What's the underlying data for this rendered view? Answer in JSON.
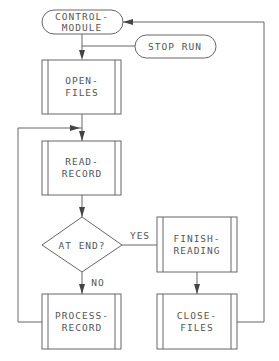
{
  "diagram": {
    "type": "flowchart",
    "nodes": {
      "control_module": {
        "shape": "terminal",
        "line1": "CONTROL-",
        "line2": "MODULE"
      },
      "stop_run": {
        "shape": "terminal",
        "label": "STOP RUN"
      },
      "open_files": {
        "shape": "predefined-process",
        "line1": "OPEN-",
        "line2": "FILES"
      },
      "read_record": {
        "shape": "predefined-process",
        "line1": "READ-",
        "line2": "RECORD"
      },
      "at_end": {
        "shape": "decision",
        "label": "AT END?"
      },
      "finish_reading": {
        "shape": "predefined-process",
        "line1": "FINISH-",
        "line2": "READING"
      },
      "process_record": {
        "shape": "predefined-process",
        "line1": "PROCESS-",
        "line2": "RECORD"
      },
      "close_files": {
        "shape": "predefined-process",
        "line1": "CLOSE-",
        "line2": "FILES"
      }
    },
    "edge_labels": {
      "yes": "YES",
      "no": "NO"
    },
    "edges": [
      {
        "from": "control_module",
        "to": "open_files"
      },
      {
        "from": "control_module",
        "to": "stop_run"
      },
      {
        "from": "open_files",
        "to": "read_record"
      },
      {
        "from": "read_record",
        "to": "at_end"
      },
      {
        "from": "at_end",
        "to": "finish_reading",
        "label": "YES"
      },
      {
        "from": "at_end",
        "to": "process_record",
        "label": "NO"
      },
      {
        "from": "process_record",
        "to": "read_record"
      },
      {
        "from": "finish_reading",
        "to": "close_files"
      },
      {
        "from": "close_files",
        "to": "control_module"
      }
    ]
  }
}
